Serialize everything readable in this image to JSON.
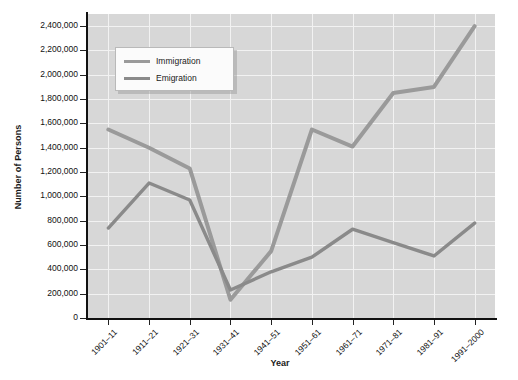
{
  "chart_data": {
    "type": "line",
    "title": "",
    "xlabel": "Year",
    "ylabel": "Number of Persons",
    "categories": [
      "1901–11",
      "1911–21",
      "1921–31",
      "1931–41",
      "1941–51",
      "1951–61",
      "1961–71",
      "1971–81",
      "1981–91",
      "1991–2000"
    ],
    "series": [
      {
        "name": "Immigration",
        "color": "#9a9a9a",
        "values": [
          1550000,
          1400000,
          1230000,
          150000,
          550000,
          1550000,
          1410000,
          1850000,
          1900000,
          2400000
        ]
      },
      {
        "name": "Emigration",
        "color": "#8a8a8a",
        "values": [
          740000,
          1110000,
          970000,
          230000,
          380000,
          500000,
          730000,
          620000,
          510000,
          780000
        ]
      }
    ],
    "ylim": [
      0,
      2500000
    ],
    "ytick_values": [
      0,
      200000,
      400000,
      600000,
      800000,
      1000000,
      1200000,
      1400000,
      1600000,
      1800000,
      2000000,
      2200000,
      2400000
    ],
    "ytick_labels": [
      "0",
      "200,000",
      "400,000",
      "600,000",
      "800,000",
      "1,000,000",
      "1,200,000",
      "1,400,000",
      "1,600,000",
      "1,800,000",
      "2,000,000",
      "2,200,000",
      "2,400,000"
    ],
    "grid": true,
    "legend_position": "upper-left-inside",
    "plot_background": "#d7d7d7",
    "gridline_color": "#f2f2f2",
    "page_background": "#ffffff"
  }
}
